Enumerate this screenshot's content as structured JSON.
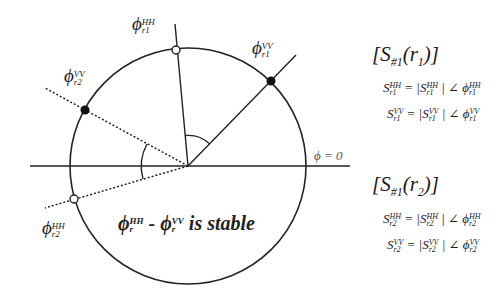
{
  "diagram": {
    "center": [
      188,
      166
    ],
    "radius": 118,
    "reference_label": "ϕ = 0",
    "stable_text": {
      "phi": "ϕ",
      "sub": "r",
      "sup_hh": "HH",
      "sup_vv": "VV",
      "minus": " - ",
      "suffix": " is stable"
    },
    "points": [
      {
        "name": "phi-r1-HH",
        "symbol": "ϕ",
        "sup": "HH",
        "sub": "r1",
        "marker": "open",
        "line": "solid"
      },
      {
        "name": "phi-r1-VV",
        "symbol": "ϕ",
        "sup": "VV",
        "sub": "r1",
        "marker": "filled",
        "line": "solid"
      },
      {
        "name": "phi-r2-VV",
        "symbol": "ϕ",
        "sup": "VV",
        "sub": "r2",
        "marker": "filled",
        "line": "dotted"
      },
      {
        "name": "phi-r2-HH",
        "symbol": "ϕ",
        "sup": "HH",
        "sub": "r2",
        "marker": "open",
        "line": "dotted"
      }
    ]
  },
  "matrices": [
    {
      "title_open": "[S",
      "title_sub": "#1",
      "title_arg": "(r",
      "title_arg_sub": "1",
      "title_close": ")]",
      "equations": [
        {
          "lhs": "S",
          "pol": "HH",
          "idx": "r1",
          "eq": " = |",
          "abs": "S",
          "mid": " | ∠ ",
          "phi": "ϕ"
        },
        {
          "lhs": "S",
          "pol": "VV",
          "idx": "r1",
          "eq": " = |",
          "abs": "S",
          "mid": " | ∠ ",
          "phi": "ϕ"
        }
      ]
    },
    {
      "title_open": "[S",
      "title_sub": "#1",
      "title_arg": "(r",
      "title_arg_sub": "2",
      "title_close": ")]",
      "equations": [
        {
          "lhs": "S",
          "pol": "HH",
          "idx": "r2",
          "eq": " = |",
          "abs": "S",
          "mid": " | ∠ ",
          "phi": "ϕ"
        },
        {
          "lhs": "S",
          "pol": "VV",
          "idx": "r2",
          "eq": " = |",
          "abs": "S",
          "mid": " | ∠ ",
          "phi": "ϕ"
        }
      ]
    }
  ]
}
